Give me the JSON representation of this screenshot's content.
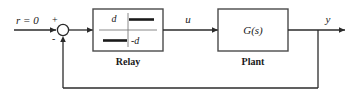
{
  "diagram": {
    "background_color": "#ffffff",
    "line_color": "#2b2b2b",
    "block_border_color": "#4a4a4a",
    "signals": {
      "reference": "r = 0",
      "control": "u",
      "output": "y"
    },
    "summing_junction": {
      "name": "summing-junction",
      "plus_sign": "+",
      "minus_sign": "-"
    },
    "blocks": [
      {
        "id": "relay",
        "caption": "Relay",
        "inner_label_upper": "d",
        "inner_label_lower": "-d",
        "type": "ideal-relay-characteristic"
      },
      {
        "id": "plant",
        "caption": "Plant",
        "transfer_function": "G(s)",
        "type": "transfer-function"
      }
    ],
    "feedback": {
      "name": "feedback-path",
      "description": "negative unity feedback from output to summing junction"
    }
  }
}
